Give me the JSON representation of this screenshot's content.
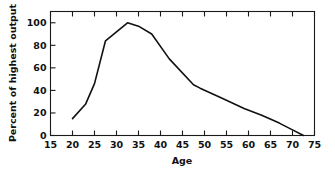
{
  "chart_data": {
    "type": "line",
    "title": "",
    "subtitle": "",
    "xlabel": "Age",
    "ylabel": "Percent of highest output",
    "xlim": [
      15,
      75
    ],
    "ylim": [
      0,
      110
    ],
    "xticks": [
      15,
      20,
      25,
      30,
      35,
      40,
      45,
      50,
      55,
      60,
      65,
      70,
      75
    ],
    "xticklabels": [
      "15",
      "20",
      "25",
      "30",
      "35",
      "40",
      "45",
      "50",
      "55",
      "60",
      "65",
      "70",
      "75"
    ],
    "yticks": [
      0,
      20,
      40,
      60,
      80,
      100
    ],
    "yticklabels": [
      "0",
      "20",
      "40",
      "60",
      "80",
      "100"
    ],
    "grid": false,
    "legend": "none",
    "frame": "box",
    "tick_direction": "in",
    "line_color": "#111111",
    "series": [
      {
        "name": "Percent of highest output",
        "x": [
          20,
          23,
          25,
          27.5,
          30,
          32.5,
          35,
          38,
          42,
          47.5,
          49,
          54,
          59,
          63,
          67,
          70,
          72.5
        ],
        "values": [
          15,
          28,
          46,
          84,
          92,
          100,
          97,
          90,
          68,
          45,
          42,
          33,
          24,
          18,
          11,
          5,
          0
        ]
      }
    ]
  },
  "axes": {
    "x_title": "Age",
    "y_title": "Percent of highest output"
  }
}
